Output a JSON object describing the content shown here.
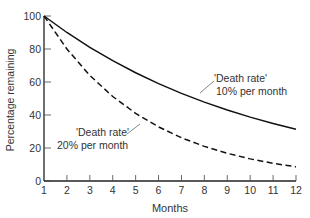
{
  "chart_data": {
    "type": "line",
    "title": "",
    "xlabel": "Months",
    "ylabel": "Percentage remaining",
    "x": [
      1,
      2,
      3,
      4,
      5,
      6,
      7,
      8,
      9,
      10,
      11,
      12
    ],
    "xlim": [
      1,
      12
    ],
    "ylim": [
      0,
      100
    ],
    "xticks": [
      "1",
      "2",
      "3",
      "4",
      "5",
      "6",
      "7",
      "8",
      "9",
      "10",
      "11",
      "12"
    ],
    "yticks": [
      "0",
      "20",
      "40",
      "60",
      "80",
      "100"
    ],
    "grid": false,
    "series": [
      {
        "name": "'Death rate' 10% per month",
        "style": "solid",
        "values": [
          100,
          90,
          81,
          72.9,
          65.6,
          59,
          53.1,
          47.8,
          43,
          38.7,
          34.9,
          31.4
        ]
      },
      {
        "name": "'Death rate' 20% per month",
        "style": "dashed",
        "values": [
          100,
          80,
          64,
          51.2,
          41,
          32.8,
          26.2,
          21,
          16.8,
          13.4,
          10.7,
          8.6
        ]
      }
    ],
    "annotations": [
      {
        "series": 0,
        "line1": "'Death rate'",
        "line2": "10% per month"
      },
      {
        "series": 1,
        "line1": "'Death rate'",
        "line2": "20% per month"
      }
    ]
  }
}
